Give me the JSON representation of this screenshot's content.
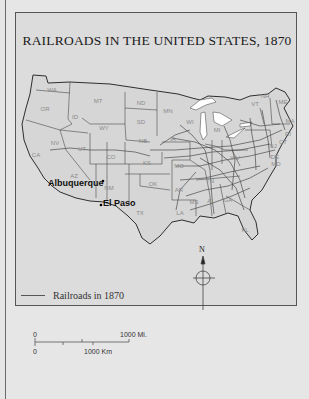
{
  "title": "RAILROADS IN THE UNITED STATES, 1870",
  "states": [
    {
      "abbr": "WA",
      "x": 52,
      "y": 92
    },
    {
      "abbr": "OR",
      "x": 45,
      "y": 111
    },
    {
      "abbr": "ID",
      "x": 75,
      "y": 119
    },
    {
      "abbr": "MT",
      "x": 98,
      "y": 103
    },
    {
      "abbr": "WY",
      "x": 104,
      "y": 130
    },
    {
      "abbr": "ND",
      "x": 141,
      "y": 105
    },
    {
      "abbr": "SD",
      "x": 141,
      "y": 124
    },
    {
      "abbr": "MN",
      "x": 168,
      "y": 113
    },
    {
      "abbr": "NB",
      "x": 143,
      "y": 143
    },
    {
      "abbr": "NV",
      "x": 55,
      "y": 145
    },
    {
      "abbr": "UT",
      "x": 82,
      "y": 151
    },
    {
      "abbr": "CO",
      "x": 111,
      "y": 159
    },
    {
      "abbr": "KS",
      "x": 147,
      "y": 165
    },
    {
      "abbr": "CA",
      "x": 36,
      "y": 157
    },
    {
      "abbr": "AZ",
      "x": 74,
      "y": 178
    },
    {
      "abbr": "NM",
      "x": 109,
      "y": 190
    },
    {
      "abbr": "OK",
      "x": 153,
      "y": 186
    },
    {
      "abbr": "TX",
      "x": 140,
      "y": 215
    },
    {
      "abbr": "WI",
      "x": 190,
      "y": 124
    },
    {
      "abbr": "IA",
      "x": 173,
      "y": 141
    },
    {
      "abbr": "MO",
      "x": 179,
      "y": 168
    },
    {
      "abbr": "AR",
      "x": 179,
      "y": 192
    },
    {
      "abbr": "LA",
      "x": 180,
      "y": 215
    },
    {
      "abbr": "MS",
      "x": 194,
      "y": 204
    },
    {
      "abbr": "AL",
      "x": 211,
      "y": 203
    },
    {
      "abbr": "GA",
      "x": 228,
      "y": 202
    },
    {
      "abbr": "FL",
      "x": 245,
      "y": 232
    },
    {
      "abbr": "TN",
      "x": 210,
      "y": 183
    },
    {
      "abbr": "MI",
      "x": 217,
      "y": 132
    },
    {
      "abbr": "WV",
      "x": 235,
      "y": 160
    },
    {
      "abbr": "VT",
      "x": 255,
      "y": 106
    },
    {
      "abbr": "NH",
      "x": 265,
      "y": 98
    },
    {
      "abbr": "ME",
      "x": 283,
      "y": 104
    },
    {
      "abbr": "MA",
      "x": 290,
      "y": 123
    },
    {
      "abbr": "RI",
      "x": 288,
      "y": 136
    },
    {
      "abbr": "CT",
      "x": 283,
      "y": 144
    },
    {
      "abbr": "NJ",
      "x": 273,
      "y": 148
    },
    {
      "abbr": "DE",
      "x": 275,
      "y": 159
    },
    {
      "abbr": "MD",
      "x": 276,
      "y": 166
    }
  ],
  "cities": [
    {
      "name": "Albuquerque",
      "x": 100,
      "y": 185
    },
    {
      "name": "El Paso",
      "x": 101,
      "y": 205
    }
  ],
  "compass": {
    "label": "N"
  },
  "legend": {
    "label": "Railroads in 1870"
  },
  "scale": {
    "top_zero": "0",
    "top_label": "1000 Mi.",
    "bottom_zero": "0",
    "bottom_label": "1000 Km"
  },
  "colors": {
    "land": "#d8d8d8",
    "water": "#ffffff",
    "border": "#3a3a3a",
    "rail": "#4a4a4a",
    "state_label": "#8a8a8a"
  }
}
